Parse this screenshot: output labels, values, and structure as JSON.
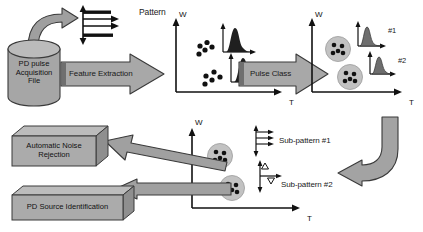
{
  "diagram": {
    "colors": {
      "fill_gray": "#a8a8a8",
      "fill_gray_dark": "#8d8d8d",
      "fill_gray_light": "#c4c4c4",
      "cluster_halo": "#bdbdbd",
      "outline": "#3a3a3a",
      "text": "#111111",
      "background": "#ffffff"
    },
    "source_file": {
      "shape": "cylinder",
      "lines": [
        "PD pulse",
        "Acquisition",
        "File"
      ],
      "text": "PD pulse Acquisition File"
    },
    "pattern_icon": {
      "label": "Pattern",
      "name": "pattern-waveform-icon"
    },
    "process_arrows": [
      {
        "id": "feature-extraction",
        "label": "Feature Extraction"
      },
      {
        "id": "pulse-class",
        "label": "Pulse Class"
      }
    ],
    "plots": [
      {
        "id": "feature-space-plot",
        "xlabel": "T",
        "ylabel": "W",
        "clusters": [
          {
            "id": "cluster-a",
            "cx": 40,
            "cy": 33,
            "circled": false
          },
          {
            "id": "cluster-b",
            "cx": 52,
            "cy": 64,
            "circled": false
          }
        ],
        "peaks": [
          {
            "id": "peak-a",
            "label": ""
          },
          {
            "id": "peak-b",
            "label": ""
          }
        ]
      },
      {
        "id": "classified-plot",
        "xlabel": "T",
        "ylabel": "W",
        "clusters": [
          {
            "id": "cluster-1",
            "circled": true
          },
          {
            "id": "cluster-2",
            "circled": true
          }
        ],
        "peaks": [
          {
            "id": "peak-1",
            "label": "#1"
          },
          {
            "id": "peak-2",
            "label": "#2"
          }
        ]
      },
      {
        "id": "subpattern-plot",
        "xlabel": "T",
        "ylabel": "W",
        "clusters": [
          {
            "id": "sub-cluster-1",
            "circled": true
          },
          {
            "id": "sub-cluster-2",
            "circled": true
          }
        ],
        "subpatterns": [
          {
            "id": "subpattern-1",
            "label": "Sub-pattern #1",
            "icon": "bars-waveform-icon"
          },
          {
            "id": "subpattern-2",
            "label": "Sub-pattern #2",
            "icon": "triangle-axes-icon"
          }
        ]
      }
    ],
    "output_boxes": [
      {
        "id": "automatic-noise-rejection",
        "lines": [
          "Automatic Noise",
          "Rejection"
        ],
        "text": "Automatic Noise Rejection"
      },
      {
        "id": "pd-source-identification",
        "lines": [
          "PD Source Identification"
        ],
        "text": "PD Source Identification"
      }
    ],
    "connectors": [
      {
        "id": "curved-arrow-top-left",
        "from": "pd-pulse-acquisition-file",
        "to": "pattern-icon"
      },
      {
        "id": "curved-arrow-right",
        "from": "classified-plot",
        "to": "subpattern-plot"
      },
      {
        "id": "arrow-to-noise-rejection",
        "from": "subpattern-plot",
        "to": "automatic-noise-rejection"
      },
      {
        "id": "arrow-to-source-identification",
        "from": "subpattern-plot",
        "to": "pd-source-identification"
      }
    ]
  }
}
